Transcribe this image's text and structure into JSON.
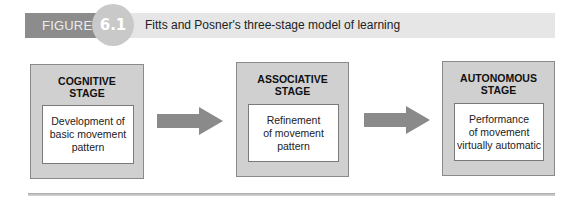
{
  "figure": {
    "label": "FIGURE",
    "number": "6.1",
    "title": "Fitts and Posner's three-stage model of learning"
  },
  "stages": [
    {
      "title_line1": "COGNITIVE",
      "title_line2": "STAGE",
      "desc_line1": "Development of",
      "desc_line2": "basic movement",
      "desc_line3": "pattern"
    },
    {
      "title_line1": "ASSOCIATIVE",
      "title_line2": "STAGE",
      "desc_line1": "Refinement",
      "desc_line2": "of movement",
      "desc_line3": "pattern"
    },
    {
      "title_line1": "AUTONOMOUS",
      "title_line2": "STAGE",
      "desc_line1": "Performance",
      "desc_line2": "of movement",
      "desc_line3": "virtually automatic"
    }
  ],
  "arrows": [
    {
      "from": "COGNITIVE STAGE",
      "to": "ASSOCIATIVE STAGE",
      "icon": "arrow-right-icon"
    },
    {
      "from": "ASSOCIATIVE STAGE",
      "to": "AUTONOMOUS STAGE",
      "icon": "arrow-right-icon"
    }
  ],
  "colors": {
    "header_bar": "#e6e6e6",
    "label_bg": "#8c8c8c",
    "circle": "#c9c9c9",
    "stage_box": "#d0d0d0",
    "arrow": "#8a8a8a"
  }
}
